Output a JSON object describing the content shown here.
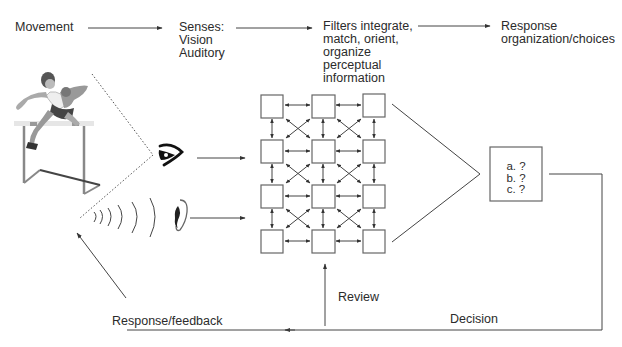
{
  "top_flow": {
    "movement": "Movement",
    "senses": "Senses:\nVision\nAuditory",
    "filters": "Filters integrate,\nmatch, orient,\norganize\nperceptual\ninformation",
    "response": "Response\norganization/choices"
  },
  "decision_box": {
    "options": [
      "a. ?",
      "b. ?",
      "c. ?"
    ]
  },
  "bottom_labels": {
    "review": "Review",
    "decision": "Decision",
    "feedback": "Response/feedback"
  },
  "icons": {
    "athlete": "hurdler-illustration",
    "eye": "eye-icon",
    "ear": "ear-icon",
    "sound_waves": "sound-waves-icon"
  },
  "colors": {
    "line": "#444444",
    "box_stroke": "#666666",
    "text": "#2b2b2b",
    "background": "#ffffff"
  }
}
